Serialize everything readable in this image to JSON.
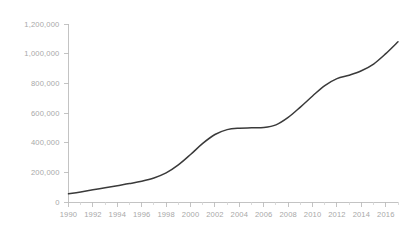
{
  "chart_data": {
    "type": "line",
    "title": "",
    "subtitle": "",
    "xlabel": "",
    "ylabel": "",
    "xlim": [
      1990,
      2017
    ],
    "ylim": [
      0,
      1200000
    ],
    "grid": false,
    "legend": null,
    "line_color": "#3a3a3a",
    "axis_color": "#bdbdbd",
    "label_color": "#a8a8a8",
    "background_color": "#ffffff",
    "y_ticks": [
      0,
      200000,
      400000,
      600000,
      800000,
      1000000,
      1200000
    ],
    "y_tick_labels": [
      "0",
      "200,000",
      "400,000",
      "600,000",
      "800,000",
      "1,000,000",
      "1,200,000"
    ],
    "x_ticks": [
      1990,
      1992,
      1994,
      1996,
      1998,
      2000,
      2002,
      2004,
      2006,
      2008,
      2010,
      2012,
      2014,
      2016
    ],
    "x_tick_labels": [
      "1990",
      "1992",
      "1994",
      "1996",
      "1998",
      "2000",
      "2002",
      "2004",
      "2006",
      "2008",
      "2010",
      "2012",
      "2014",
      "2016"
    ],
    "x": [
      1990,
      1991,
      1992,
      1993,
      1994,
      1995,
      1996,
      1997,
      1998,
      1999,
      2000,
      2001,
      2002,
      2003,
      2004,
      2005,
      2006,
      2007,
      2008,
      2009,
      2010,
      2011,
      2012,
      2013,
      2014,
      2015,
      2016,
      2017
    ],
    "series": [
      {
        "name": "value",
        "values": [
          55000,
          68000,
          82000,
          96000,
          110000,
          124000,
          140000,
          162000,
          196000,
          250000,
          320000,
          395000,
          455000,
          488000,
          498000,
          500000,
          502000,
          520000,
          570000,
          640000,
          715000,
          785000,
          832000,
          855000,
          885000,
          930000,
          1000000,
          1080000
        ]
      }
    ]
  }
}
